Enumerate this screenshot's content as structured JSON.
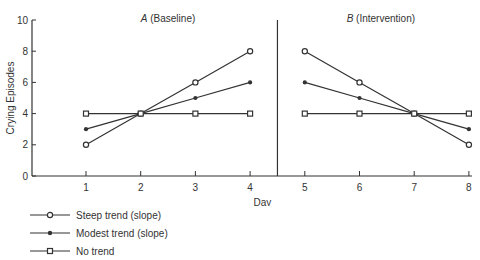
{
  "chart_data": {
    "type": "line",
    "title": "",
    "phases": [
      {
        "label_italic": "A",
        "label_rest": " (Baseline)",
        "days": [
          1,
          2,
          3,
          4
        ]
      },
      {
        "label_italic": "B",
        "label_rest": " (Intervention)",
        "days": [
          5,
          6,
          7,
          8
        ]
      }
    ],
    "xlabel": "Day",
    "ylabel": "Crying Episodes",
    "x_ticks": [
      1,
      2,
      3,
      4,
      5,
      6,
      7,
      8
    ],
    "y_ticks": [
      0,
      2,
      4,
      6,
      8,
      10
    ],
    "ylim": [
      0,
      10
    ],
    "phase_divider_x": 4.5,
    "series": [
      {
        "name": "Steep trend (slope)",
        "marker": "open-circle",
        "values": [
          2,
          4,
          6,
          8,
          8,
          6,
          4,
          2
        ]
      },
      {
        "name": "Modest trend (slope)",
        "marker": "filled-circle",
        "values": [
          3,
          4,
          5,
          6,
          6,
          5,
          4,
          3
        ]
      },
      {
        "name": "No trend",
        "marker": "open-square",
        "values": [
          4,
          4,
          4,
          4,
          4,
          4,
          4,
          4
        ]
      }
    ],
    "legend_position": "bottom-left",
    "grid": false
  },
  "legend": {
    "items": [
      {
        "label": "Steep trend (slope)"
      },
      {
        "label": "Modest trend (slope)"
      },
      {
        "label": "No trend"
      }
    ]
  }
}
